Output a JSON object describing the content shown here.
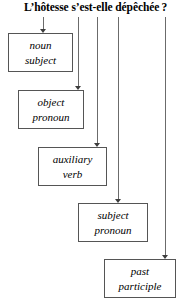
{
  "diagram": {
    "title": "L’hôtesse s’est-elle dépêchée ?",
    "type": "flowchart",
    "orientation": "vertical-cascade",
    "colors": {
      "background": "#ffffff",
      "box_border": "#555555",
      "connector": "#6b6b6b",
      "arrowhead": "#3d3d3d",
      "text": "#000000"
    },
    "nodes": [
      {
        "id": "noun-subject",
        "line1": "noun",
        "line2": "subject",
        "x": 8,
        "y": 33,
        "w": 65,
        "h": 39
      },
      {
        "id": "object-pronoun",
        "line1": "object",
        "line2": "pronoun",
        "x": 18,
        "y": 90,
        "w": 66,
        "h": 39
      },
      {
        "id": "auxiliary-verb",
        "line1": "auxiliary",
        "line2": "verb",
        "x": 38,
        "y": 147,
        "w": 69,
        "h": 39
      },
      {
        "id": "subject-pronoun",
        "line1": "subject",
        "line2": "pronoun",
        "x": 78,
        "y": 203,
        "w": 70,
        "h": 39
      },
      {
        "id": "past-participle",
        "line1": "past",
        "line2": "participle",
        "x": 104,
        "y": 259,
        "w": 72,
        "h": 39
      }
    ],
    "connectors": [
      {
        "id": "to-noun-subject",
        "x": 43,
        "y_top": 17,
        "y_bottom": 33
      },
      {
        "id": "to-object-pronoun",
        "x": 78,
        "y_top": 17,
        "y_bottom": 90
      },
      {
        "id": "to-auxiliary-verb",
        "x": 97,
        "y_top": 17,
        "y_bottom": 147
      },
      {
        "id": "to-subject-pronoun",
        "x": 118,
        "y_top": 17,
        "y_bottom": 203
      },
      {
        "id": "to-past-participle",
        "x": 165,
        "y_top": 17,
        "y_bottom": 259
      }
    ]
  }
}
